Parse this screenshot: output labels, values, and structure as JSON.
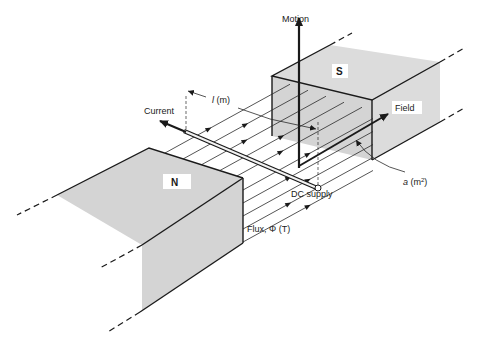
{
  "figure": {
    "labels": {
      "motion": "Motion",
      "current": "Current",
      "field": "Field",
      "length": "l (m)",
      "length_var": "l",
      "length_unit": " (m)",
      "dc_supply": "DC supply",
      "flux": "Flux, Φ (T)",
      "area": "a (m",
      "area_var": "a",
      "area_unit": " (m",
      "area_sup": "2",
      "area_close": ")",
      "north_pole": "N",
      "south_pole": "S"
    },
    "colors": {
      "pole_shade": "#d4d4d4",
      "line": "#1a1a1a",
      "background": "#ffffff"
    }
  }
}
